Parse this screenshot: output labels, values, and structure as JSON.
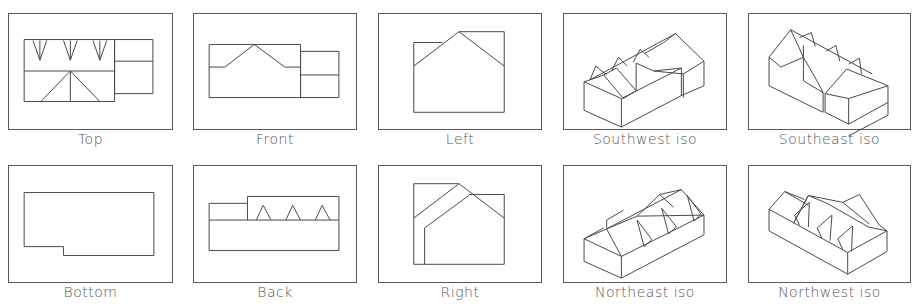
{
  "views": [
    {
      "id": "top",
      "label": "Top",
      "row": 1,
      "col": 1
    },
    {
      "id": "front",
      "label": "Front",
      "row": 1,
      "col": 2
    },
    {
      "id": "left",
      "label": "Left",
      "row": 1,
      "col": 3
    },
    {
      "id": "southwest-iso",
      "label": "Southwest iso",
      "row": 1,
      "col": 4
    },
    {
      "id": "southeast-iso",
      "label": "Southeast iso",
      "row": 1,
      "col": 5
    },
    {
      "id": "bottom",
      "label": "Bottom",
      "row": 2,
      "col": 1
    },
    {
      "id": "back",
      "label": "Back",
      "row": 2,
      "col": 2
    },
    {
      "id": "right",
      "label": "Right",
      "row": 2,
      "col": 3
    },
    {
      "id": "northeast-iso",
      "label": "Northeast iso",
      "row": 2,
      "col": 4
    },
    {
      "id": "northwest-iso",
      "label": "Northwest iso",
      "row": 2,
      "col": 5
    }
  ],
  "colors": {
    "line": "#4a4a4a",
    "frame": "#5a5a5a",
    "label": "#555555",
    "background": "#ffffff"
  }
}
